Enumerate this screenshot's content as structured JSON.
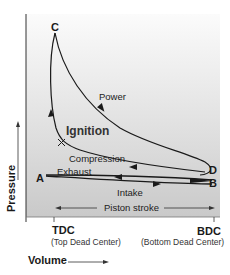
{
  "diagram": {
    "points": {
      "A": "A",
      "B": "B",
      "C": "C",
      "D": "D"
    },
    "phases": {
      "power": "Power",
      "ignition": "Ignition",
      "compression": "Compression",
      "exhaust": "Exhaust",
      "intake": "Intake",
      "piston_stroke": "Piston stroke"
    },
    "axes": {
      "y_label": "Pressure",
      "x_label": "Volume",
      "tdc": "TDC",
      "tdc_full": "(Top Dead Center)",
      "bdc": "BDC",
      "bdc_full": "(Bottom Dead Center)"
    },
    "colors": {
      "line": "#1a1a1a",
      "plot_bg_bottom": "#c9c9c9",
      "plot_bg_top": "#fbfbfb"
    }
  }
}
